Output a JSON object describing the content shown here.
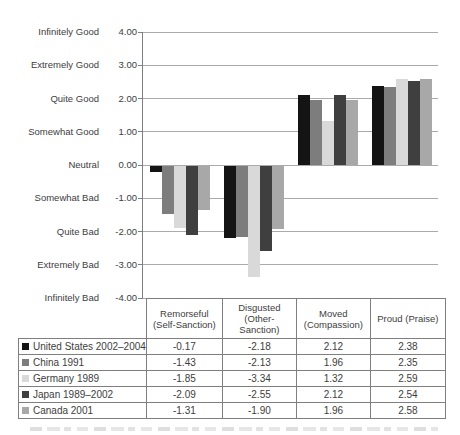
{
  "figure": {
    "background": "#ffffff",
    "text_color": "#3d3d3d",
    "gridline_color": "#aaaaaa",
    "axis_color": "#7f7f7f",
    "table_border_color": "#7f7f7f"
  },
  "chart_data": {
    "type": "bar",
    "categories": [
      "Remorseful\n(Self-Sanction)",
      "Disgusted\n(Other-\nSanction)",
      "Moved\n(Compassion)",
      "Proud (Praise)"
    ],
    "series": [
      {
        "name": "United States 2002–2004",
        "color": "#141414",
        "values": [
          -0.17,
          -2.18,
          2.12,
          2.38
        ]
      },
      {
        "name": "China 1991",
        "color": "#7d7d7d",
        "values": [
          -1.43,
          -2.13,
          1.96,
          2.35
        ]
      },
      {
        "name": "Germany 1989",
        "color": "#d9d9d9",
        "values": [
          -1.85,
          -3.34,
          1.32,
          2.59
        ]
      },
      {
        "name": "Japan 1989–2002",
        "color": "#3f3f3f",
        "values": [
          -2.09,
          -2.55,
          2.12,
          2.54
        ]
      },
      {
        "name": "Canada 2001",
        "color": "#a8a8a8",
        "values": [
          -1.31,
          -1.9,
          1.96,
          2.58
        ]
      }
    ],
    "y_axis": {
      "min": -4,
      "max": 4,
      "step": 1,
      "ticks": [
        {
          "word": "Infinitely Good",
          "value": "4.00"
        },
        {
          "word": "Extremely Good",
          "value": "3.00"
        },
        {
          "word": "Quite Good",
          "value": "2.00"
        },
        {
          "word": "Somewhat Good",
          "value": "1.00"
        },
        {
          "word": "Neutral",
          "value": "0.00"
        },
        {
          "word": "Somewhat Bad",
          "value": "-1.00"
        },
        {
          "word": "Quite Bad",
          "value": "-2.00"
        },
        {
          "word": "Extremely Bad",
          "value": "-3.00"
        },
        {
          "word": "Infinitely Bad",
          "value": "-4.00"
        }
      ]
    },
    "grid": true,
    "legend_position": "table-left",
    "value_format": "0.00"
  }
}
